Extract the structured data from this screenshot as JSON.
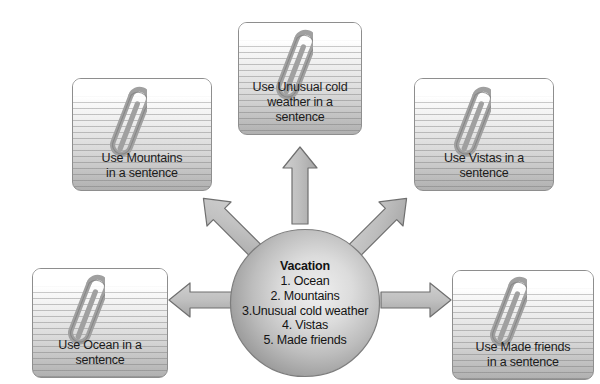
{
  "diagram": {
    "center": {
      "heading": "Vacation",
      "items": [
        "1. Ocean",
        "2. Mountains",
        "3.Unusual cold weather",
        "4. Vistas",
        "5. Made friends"
      ]
    },
    "cards": [
      {
        "id": "unusual-cold-weather",
        "lines": [
          "Use Unusual cold",
          "weather in a",
          "sentence"
        ],
        "icon": "paperclip-icon"
      },
      {
        "id": "mountains",
        "lines": [
          "Use Mountains",
          "in a sentence"
        ],
        "icon": "paperclip-icon"
      },
      {
        "id": "vistas",
        "lines": [
          "Use Vistas in a",
          "sentence"
        ],
        "icon": "paperclip-icon"
      },
      {
        "id": "ocean",
        "lines": [
          "Use Ocean in a",
          "sentence"
        ],
        "icon": "paperclip-icon"
      },
      {
        "id": "made-friends",
        "lines": [
          "Use Made friends",
          "in a sentence"
        ],
        "icon": "paperclip-icon"
      }
    ],
    "arrows": [
      {
        "id": "arrow-to-unusual-cold-weather",
        "direction": "up"
      },
      {
        "id": "arrow-to-mountains",
        "direction": "up-left"
      },
      {
        "id": "arrow-to-vistas",
        "direction": "up-right"
      },
      {
        "id": "arrow-to-ocean",
        "direction": "left"
      },
      {
        "id": "arrow-to-made-friends",
        "direction": "right"
      }
    ],
    "colors": {
      "background": "#ffffff",
      "card_border": "#8e8e8e",
      "card_top": "#ffffff",
      "card_bottom": "#b0b0b0",
      "rule_line": "#6e6e6e",
      "ellipse_light": "#e8e8e8",
      "ellipse_dark": "#9a9a9a",
      "ellipse_border": "#7d7d7d",
      "arrow_fill": "#b8b8b8",
      "arrow_border": "#6f6f6f",
      "clip_metal": "#9b9b9b",
      "text": "#151515"
    }
  }
}
